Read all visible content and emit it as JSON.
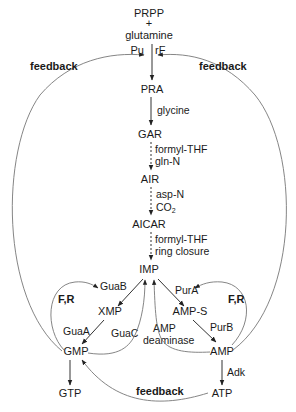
{
  "diagram": {
    "type": "metabolic-pathway",
    "nodes": {
      "prpp": "PRPP",
      "plus": "+",
      "glutamine": "glutamine",
      "pu": "Pu",
      "rf": "rF",
      "pra": "PRA",
      "gar": "GAR",
      "air": "AIR",
      "aicar": "AICAR",
      "imp": "IMP",
      "xmp": "XMP",
      "gmp": "GMP",
      "gtp": "GTP",
      "amp_s": "AMP-S",
      "amp": "AMP",
      "atp": "ATP"
    },
    "step_labels": {
      "pra_gar": "glycine",
      "gar_air_1": "formyl-THF",
      "gar_air_2": "gln-N",
      "air_aicar_1": "asp-N",
      "air_aicar_2": "CO",
      "air_aicar_2_sub": "2",
      "aicar_imp_1": "formyl-THF",
      "aicar_imp_2": "ring closure"
    },
    "enzymes": {
      "guaB": "GuaB",
      "guaA": "GuaA",
      "guaC": "GuaC",
      "purA": "PurA",
      "purB": "PurB",
      "amp_deaminase_1": "AMP",
      "amp_deaminase_2": "deaminase",
      "adk": "Adk"
    },
    "regulation": {
      "feedback_left": "feedback",
      "feedback_right": "feedback",
      "feedback_bottom": "feedback",
      "fr_left": "F,R",
      "fr_right": "F,R"
    },
    "edges": [
      {
        "from": "PRPP+glutamine",
        "to": "PRA",
        "style": "solid"
      },
      {
        "from": "PRA",
        "to": "GAR",
        "style": "solid",
        "label": "glycine"
      },
      {
        "from": "GAR",
        "to": "AIR",
        "style": "dashed",
        "label": "formyl-THF, gln-N"
      },
      {
        "from": "AIR",
        "to": "AICAR",
        "style": "dashed",
        "label": "asp-N, CO2"
      },
      {
        "from": "AICAR",
        "to": "IMP",
        "style": "dashed",
        "label": "formyl-THF, ring closure"
      },
      {
        "from": "IMP",
        "to": "XMP",
        "enzyme": "GuaB"
      },
      {
        "from": "XMP",
        "to": "GMP",
        "enzyme": "GuaA"
      },
      {
        "from": "GMP",
        "to": "IMP",
        "enzyme": "GuaC"
      },
      {
        "from": "GMP",
        "to": "GTP"
      },
      {
        "from": "IMP",
        "to": "AMP-S",
        "enzyme": "PurA"
      },
      {
        "from": "AMP-S",
        "to": "AMP",
        "enzyme": "PurB"
      },
      {
        "from": "AMP",
        "to": "IMP",
        "enzyme": "AMP deaminase"
      },
      {
        "from": "AMP",
        "to": "ATP",
        "enzyme": "Adk"
      },
      {
        "from": "GMP",
        "to": "PRPP step",
        "type": "feedback"
      },
      {
        "from": "AMP",
        "to": "PRPP step",
        "type": "feedback"
      },
      {
        "from": "ATP",
        "to": "GMP",
        "type": "feedback"
      },
      {
        "from": "GMP",
        "to": "GuaB",
        "type": "F,R"
      },
      {
        "from": "AMP",
        "to": "PurA",
        "type": "F,R"
      }
    ]
  }
}
